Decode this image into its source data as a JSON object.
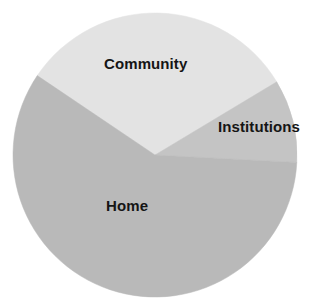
{
  "chart_data": {
    "type": "pie",
    "title": "",
    "subtitle": "",
    "xlabel": "",
    "ylabel": "",
    "grid": false,
    "legend_position": "none",
    "labels_inside": true,
    "categories": [
      "Community",
      "Institutions",
      "Home"
    ],
    "values": [
      32,
      9.5,
      58.5
    ],
    "units": "percent",
    "slices": [
      {
        "label": "Community",
        "value": 32,
        "start_angle_deg": 214,
        "end_angle_deg": 329,
        "sweep_deg": 115,
        "color": "#e3e3e3"
      },
      {
        "label": "Institutions",
        "value": 9.5,
        "start_angle_deg": 329,
        "end_angle_deg": 363,
        "sweep_deg": 34,
        "color": "#c4c4c4"
      },
      {
        "label": "Home",
        "value": 58.5,
        "start_angle_deg": 3,
        "end_angle_deg": 214,
        "sweep_deg": 211,
        "color": "#b9b9b9"
      }
    ],
    "geometry": {
      "center_x": 155,
      "center_y": 155,
      "radius": 142
    },
    "colors": {
      "community": "#e3e3e3",
      "institutions": "#c4c4c4",
      "home": "#b9b9b9",
      "label_text": "#151515",
      "background": "#ffffff"
    }
  },
  "labels": {
    "community": "Community",
    "institutions": "Institutions",
    "home": "Home"
  }
}
